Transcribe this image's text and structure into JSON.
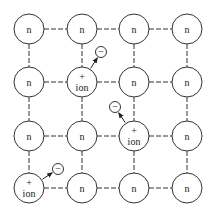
{
  "diagram": {
    "colors": {
      "stroke": "#333333",
      "background": "#ffffff"
    },
    "grid": {
      "columns_x": [
        29,
        82,
        134,
        187
      ],
      "rows_y": [
        29,
        82,
        136,
        188
      ],
      "atom_radius": 15
    },
    "atoms": [
      {
        "row": 0,
        "col": 0,
        "type": "neutral",
        "label": "n"
      },
      {
        "row": 0,
        "col": 1,
        "type": "neutral",
        "label": "n"
      },
      {
        "row": 0,
        "col": 2,
        "type": "neutral",
        "label": "n"
      },
      {
        "row": 0,
        "col": 3,
        "type": "neutral",
        "label": "n"
      },
      {
        "row": 1,
        "col": 0,
        "type": "neutral",
        "label": "n"
      },
      {
        "row": 1,
        "col": 1,
        "type": "ion",
        "label": "ion",
        "charge": "+"
      },
      {
        "row": 1,
        "col": 2,
        "type": "neutral",
        "label": "n"
      },
      {
        "row": 1,
        "col": 3,
        "type": "neutral",
        "label": "n"
      },
      {
        "row": 2,
        "col": 0,
        "type": "neutral",
        "label": "n"
      },
      {
        "row": 2,
        "col": 1,
        "type": "neutral",
        "label": "n"
      },
      {
        "row": 2,
        "col": 2,
        "type": "ion",
        "label": "ion",
        "charge": "+"
      },
      {
        "row": 2,
        "col": 3,
        "type": "neutral",
        "label": "n"
      },
      {
        "row": 3,
        "col": 0,
        "type": "ion",
        "label": "ion",
        "charge": "+"
      },
      {
        "row": 3,
        "col": 1,
        "type": "neutral",
        "label": "n"
      },
      {
        "row": 3,
        "col": 2,
        "type": "neutral",
        "label": "n"
      },
      {
        "row": 3,
        "col": 3,
        "type": "neutral",
        "label": "n"
      }
    ],
    "electrons": [
      {
        "label": "−",
        "x": 101,
        "y": 52,
        "from_row": 1,
        "from_col": 1
      },
      {
        "label": "−",
        "x": 115,
        "y": 107,
        "from_row": 2,
        "from_col": 2
      },
      {
        "label": "−",
        "x": 58,
        "y": 169,
        "from_row": 3,
        "from_col": 0
      }
    ]
  }
}
